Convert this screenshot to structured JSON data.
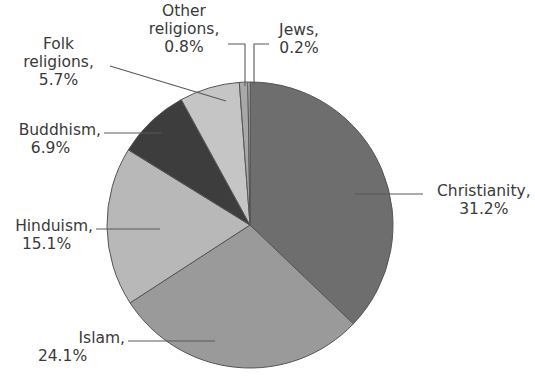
{
  "chart_data": {
    "type": "pie",
    "title": "",
    "subtitle": "",
    "xlabel": "",
    "ylabel": "",
    "units": "%",
    "legend_position": "none",
    "labels_position": "outside-with-leader-lines",
    "start_angle_deg": 0,
    "direction": "clockwise",
    "categories": [
      "Christianity",
      "Islam",
      "Hinduism",
      "Buddhism",
      "Folk religions",
      "Other religions",
      "Jews"
    ],
    "values": [
      31.2,
      24.1,
      15.1,
      6.9,
      5.7,
      0.8,
      0.2
    ],
    "colors": [
      "#6e6e6e",
      "#9a9a9a",
      "#b8b8b8",
      "#3d3d3d",
      "#c5c5c5",
      "#a8a8a8",
      "#cfcfcf"
    ],
    "slice_border_color": "#555555",
    "slices": [
      {
        "name": "Christianity",
        "value": 31.2,
        "display": "31.2%",
        "color": "#6e6e6e"
      },
      {
        "name": "Islam",
        "value": 24.1,
        "display": "24.1%",
        "color": "#9a9a9a"
      },
      {
        "name": "Hinduism",
        "value": 15.1,
        "display": "15.1%",
        "color": "#b8b8b8"
      },
      {
        "name": "Buddhism",
        "value": 6.9,
        "display": "6.9%",
        "color": "#3d3d3d"
      },
      {
        "name": "Folk religions",
        "value": 5.7,
        "display": "5.7%",
        "color": "#c5c5c5"
      },
      {
        "name": "Other religions",
        "value": 0.8,
        "display": "0.8%",
        "color": "#a8a8a8"
      },
      {
        "name": "Jews",
        "value": 0.2,
        "display": "0.2%",
        "color": "#cfcfcf"
      }
    ]
  },
  "labels": {
    "christianity": {
      "line1": "Christianity,",
      "line2": "31.2%"
    },
    "islam": {
      "line1": "Islam,",
      "line2": "24.1%"
    },
    "hinduism": {
      "line1": "Hinduism,",
      "line2": "15.1%"
    },
    "buddhism": {
      "line1": "Buddhism,",
      "line2": "6.9%"
    },
    "folk_religions": {
      "line1": "Folk",
      "line2": "religions,",
      "line3": "5.7%"
    },
    "other_religions": {
      "line1": "Other",
      "line2": "religions,",
      "line3": "0.8%"
    },
    "jews": {
      "line1": "Jews,",
      "line2": "0.2%"
    }
  },
  "style": {
    "background": "#ffffff",
    "text_color": "#3a3a3a",
    "leader_line_color": "#595959"
  }
}
